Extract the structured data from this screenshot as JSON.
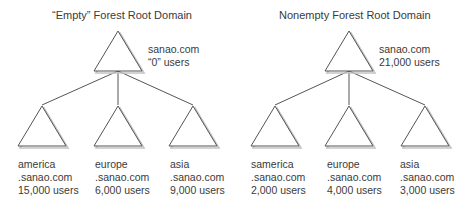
{
  "diagrams": [
    {
      "title": "“Empty” Forest Root Domain",
      "root": {
        "name": "sanao.com",
        "users": "“0” users"
      },
      "children": [
        {
          "name": "america",
          "domain": ".sanao.com",
          "users": "15,000 users"
        },
        {
          "name": "europe",
          "domain": ".sanao.com",
          "users": "6,000 users"
        },
        {
          "name": "asia",
          "domain": ".sanao.com",
          "users": "9,000 users"
        }
      ]
    },
    {
      "title": "Nonempty Forest Root Domain",
      "root": {
        "name": "sanao.com",
        "users": "21,000 users"
      },
      "children": [
        {
          "name": "samerica",
          "domain": ".sanao.com",
          "users": "2,000 users"
        },
        {
          "name": "europe",
          "domain": ".sanao.com",
          "users": "4,000 users"
        },
        {
          "name": "asia",
          "domain": ".sanao.com",
          "users": "3,000 users"
        }
      ]
    }
  ],
  "colors": {
    "stroke": "#555555",
    "shadow": "#bbbbbb",
    "text": "#3a3a3a"
  }
}
